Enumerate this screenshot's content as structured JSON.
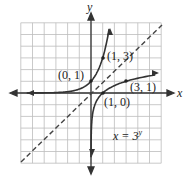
{
  "chart_data": {
    "type": "line",
    "title": "",
    "xlabel": "x",
    "ylabel": "y",
    "xlim": [
      -6,
      6
    ],
    "ylim": [
      -6,
      6
    ],
    "grid": true,
    "series": [
      {
        "name": "y = 3^x",
        "style": "solid",
        "points": [
          [
            -6,
            0.0014
          ],
          [
            -2,
            0.11
          ],
          [
            -1,
            0.33
          ],
          [
            0,
            1
          ],
          [
            1,
            3
          ],
          [
            1.5,
            5.2
          ]
        ]
      },
      {
        "name": "x = 3^y",
        "style": "solid",
        "points": [
          [
            0.0014,
            -6
          ],
          [
            0.11,
            -2
          ],
          [
            0.33,
            -1
          ],
          [
            1,
            0
          ],
          [
            3,
            1
          ],
          [
            5.2,
            1.5
          ]
        ]
      },
      {
        "name": "y = x",
        "style": "dashed",
        "points": [
          [
            -6,
            -6
          ],
          [
            6,
            6
          ]
        ]
      }
    ],
    "annotations": [
      {
        "text": "(0, 1)",
        "x": 0,
        "y": 1
      },
      {
        "text": "(1, 3)",
        "x": 1,
        "y": 3
      },
      {
        "text": "(3, 1)",
        "x": 3,
        "y": 1
      },
      {
        "text": "(1, 0)",
        "x": 1,
        "y": 0
      },
      {
        "text": "x = 3^y",
        "x": 3,
        "y": -3.5
      }
    ]
  },
  "labels": {
    "x_axis": "x",
    "y_axis": "y",
    "p01": "(0, 1)",
    "p13": "(1, 3)",
    "p31": "(3, 1)",
    "p10": "(1, 0)",
    "equation_base": "x = 3",
    "equation_exp": "y"
  }
}
